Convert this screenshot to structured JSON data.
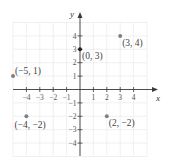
{
  "chart_data": {
    "type": "scatter",
    "title": "",
    "xlabel": "x",
    "ylabel": "y",
    "xlim": [
      -5,
      5
    ],
    "ylim": [
      -5,
      5
    ],
    "grid": true,
    "x_ticks": [
      -4,
      -3,
      -2,
      -1,
      1,
      2,
      3,
      4
    ],
    "y_ticks": [
      -4,
      -3,
      -2,
      -1,
      1,
      2,
      3,
      4
    ],
    "x_tick_labels": [
      "−4",
      "−3",
      "−2",
      "−1",
      "1",
      "2",
      "3",
      "4"
    ],
    "y_tick_labels": [
      "−4",
      "−3",
      "−2",
      "−1",
      "1",
      "2",
      "3",
      "4"
    ],
    "series": [
      {
        "name": "points",
        "points": [
          {
            "x": 3,
            "y": 4,
            "label": "(3, 4)",
            "color": "#808080",
            "label_pos": "below-right"
          },
          {
            "x": 0,
            "y": 3,
            "label": "(0, 3)",
            "color": "#222222",
            "label_pos": "below-right"
          },
          {
            "x": -5,
            "y": 1,
            "label": "(−5, 1)",
            "color": "#808080",
            "label_pos": "above-right"
          },
          {
            "x": -4,
            "y": -2,
            "label": "(−4, −2)",
            "color": "#808080",
            "label_pos": "below"
          },
          {
            "x": 2,
            "y": -2,
            "label": "(2, −2)",
            "color": "#808080",
            "label_pos": "below-right"
          }
        ]
      }
    ]
  },
  "layout": {
    "origin_px": [
      80,
      89.5
    ],
    "unit_px": 13.4,
    "grid_range": [
      -5,
      5
    ],
    "x_axis_px": [
      13,
      158
    ],
    "y_axis_px": [
      12,
      156
    ]
  }
}
